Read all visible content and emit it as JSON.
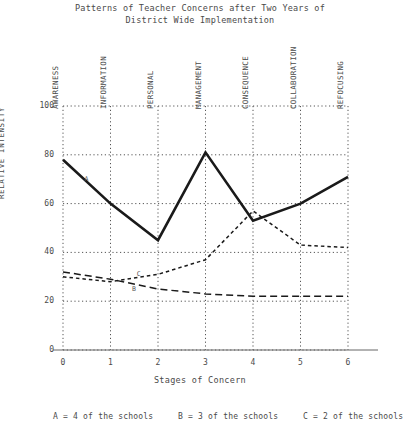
{
  "chart_data": {
    "type": "line",
    "title": "Patterns of Teacher Concerns after Two Years of\nDistrict Wide Implementation",
    "xlabel": "Stages of Concern",
    "ylabel": "RELATIVE INTENSITY",
    "x": [
      0,
      1,
      2,
      3,
      4,
      5,
      6
    ],
    "xtick_labels": [
      "0",
      "1",
      "2",
      "3",
      "4",
      "5",
      "6"
    ],
    "categories": [
      "AWARENESS",
      "INFORMATION",
      "PERSONAL",
      "MANAGEMENT",
      "CONSEQUENCE",
      "COLLABORATION",
      "REFOCUSING"
    ],
    "ytick_labels": [
      "0",
      "20",
      "40",
      "60",
      "80",
      "100"
    ],
    "ytick_values": [
      0,
      20,
      40,
      60,
      80,
      100
    ],
    "ylim": [
      0,
      100
    ],
    "xlim": [
      0,
      6
    ],
    "grid": true,
    "legend_position": "below-axes",
    "series": [
      {
        "name": "A",
        "style": "solid",
        "label": "A",
        "values": [
          78,
          60,
          45,
          81,
          53,
          60,
          71
        ],
        "legend": "A = 4 of the schools"
      },
      {
        "name": "B",
        "style": "dashed",
        "label": "B",
        "values": [
          32,
          29,
          25,
          23,
          22,
          22,
          22
        ],
        "legend": "B = 3 of the schools"
      },
      {
        "name": "C",
        "style": "dotted",
        "label": "C",
        "values": [
          30,
          28,
          31,
          37,
          57,
          43,
          42
        ],
        "legend": "C = 2 of the schools"
      }
    ],
    "annotations": [
      {
        "text": "A",
        "x": 0.45,
        "y": 70
      },
      {
        "text": "B",
        "x": 1.45,
        "y": 25
      },
      {
        "text": "C",
        "x": 1.55,
        "y": 31
      }
    ],
    "colors": {
      "line": "#1a1a1a",
      "grid": "#555555",
      "text": "#4a4a4a",
      "background": "#ffffff"
    }
  }
}
